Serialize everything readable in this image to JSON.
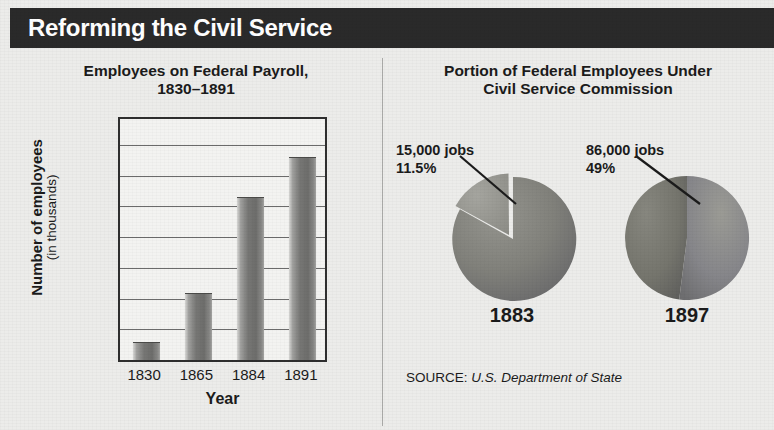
{
  "header": {
    "title": "Reforming the Civil Service"
  },
  "colors": {
    "header_bg": "#2a2a2a",
    "page_bg": "#ececea",
    "bar_fill": "#777775",
    "pie_major": "#7a7a78",
    "pie_minor": "#90908e",
    "grid": "#6b6b6b"
  },
  "left_panel": {
    "title_line1": "Employees on Federal Payroll,",
    "title_line2": "1830–1891",
    "ylabel_line1": "Number of employees",
    "ylabel_line2": "(in thousands)",
    "xlabel": "Year"
  },
  "right_panel": {
    "title_line1": "Portion of Federal Employees Under",
    "title_line2": "Civil Service Commission",
    "source_label": "SOURCE:",
    "source_value": "U.S. Department of State"
  },
  "chart_data": [
    {
      "type": "bar",
      "title": "Employees on Federal Payroll, 1830–1891",
      "xlabel": "Year",
      "ylabel": "Number of employees (in thousands)",
      "categories": [
        "1830",
        "1865",
        "1884",
        "1891"
      ],
      "values": [
        15,
        55,
        133,
        165
      ],
      "ylim": [
        1,
        200
      ],
      "yticks": [
        200,
        175,
        150,
        125,
        100,
        75,
        50,
        25,
        1
      ],
      "ytick_labels": [
        "200",
        "175",
        "150",
        "125",
        "100",
        "75",
        "50",
        "25",
        "1"
      ],
      "grid": true,
      "legend": "none",
      "units": "thousands of employees"
    },
    {
      "type": "pie",
      "title": "Portion of Federal Employees Under Civil Service Commission",
      "year": "1883",
      "labels": [
        "Under Civil Service Commission",
        "Not under Civil Service Commission"
      ],
      "values": [
        11.5,
        88.5
      ],
      "callout_line1": "15,000 jobs",
      "callout_line2": "11.5%",
      "exploded_slice": 0
    },
    {
      "type": "pie",
      "title": "Portion of Federal Employees Under Civil Service Commission",
      "year": "1897",
      "labels": [
        "Under Civil Service Commission",
        "Not under Civil Service Commission"
      ],
      "values": [
        49,
        51
      ],
      "callout_line1": "86,000 jobs",
      "callout_line2": "49%",
      "exploded_slice": null
    }
  ]
}
